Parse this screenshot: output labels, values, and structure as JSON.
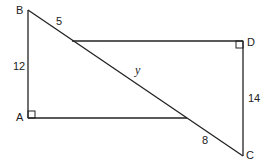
{
  "diagram": {
    "points": {
      "A": "A",
      "B": "B",
      "C": "C",
      "D": "D"
    },
    "lengths": {
      "AB": "12",
      "B_to_intersection": "5",
      "DC": "14",
      "intersection_to_C": "8",
      "unknown": "y"
    },
    "line_color": "#222222"
  }
}
